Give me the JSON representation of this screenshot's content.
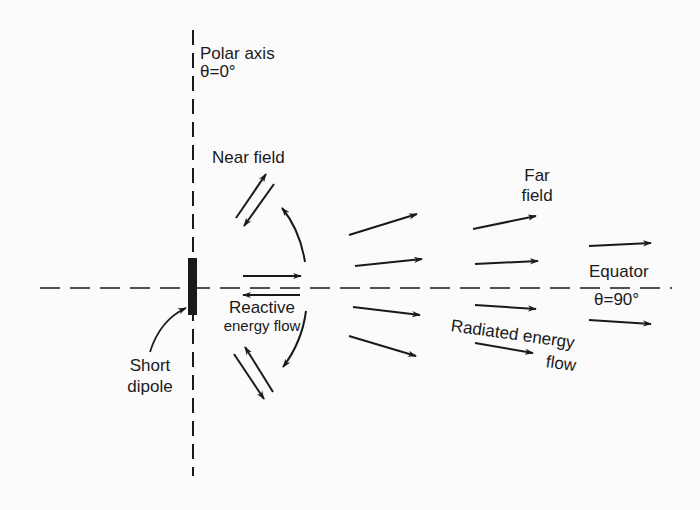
{
  "diagram": {
    "colors": {
      "ink": "#1a1a1a",
      "background": "#fbfbfb"
    },
    "labels": {
      "polar_axis": "Polar axis",
      "polar_angle": "θ=0°",
      "near_field": "Near field",
      "far_field_line1": "Far",
      "far_field_line2": "field",
      "equator": "Equator",
      "equator_angle": "θ=90°",
      "reactive_line1": "Reactive",
      "reactive_line2": "energy flow",
      "radiated_line1": "Radiated energy",
      "radiated_line2": "flow",
      "dipole_line1": "Short",
      "dipole_line2": "dipole"
    },
    "elements": {
      "polar_axis_line": {
        "x": 193,
        "y1": 30,
        "y2": 476,
        "style": "dashed"
      },
      "equator_line": {
        "y": 288,
        "x1": 40,
        "x2": 672,
        "style": "dashed"
      },
      "dipole": {
        "x": 188,
        "y": 258,
        "width": 9,
        "height": 57
      },
      "near_field_arrows": [
        {
          "from": [
            236,
            218
          ],
          "to": [
            266,
            174
          ]
        },
        {
          "from": [
            274,
            184
          ],
          "to": [
            244,
            226
          ]
        },
        {
          "from": [
            243,
            276
          ],
          "to": [
            301,
            276
          ]
        },
        {
          "from": [
            300,
            295
          ],
          "to": [
            243,
            295
          ]
        },
        {
          "from": [
            234,
            354
          ],
          "to": [
            264,
            399
          ]
        },
        {
          "from": [
            273,
            392
          ],
          "to": [
            245,
            347
          ]
        }
      ],
      "curved_arrows": [
        {
          "path": "M305,262 Q300,230 282,208"
        },
        {
          "path": "M306,311 Q302,342 283,367"
        }
      ],
      "far_field_arrows": [
        {
          "from": [
            349,
            235
          ],
          "to": [
            417,
            214
          ]
        },
        {
          "from": [
            355,
            266
          ],
          "to": [
            422,
            259
          ]
        },
        {
          "from": [
            353,
            307
          ],
          "to": [
            420,
            315
          ]
        },
        {
          "from": [
            349,
            336
          ],
          "to": [
            416,
            356
          ]
        },
        {
          "from": [
            473,
            229
          ],
          "to": [
            536,
            216
          ]
        },
        {
          "from": [
            475,
            264
          ],
          "to": [
            538,
            261
          ]
        },
        {
          "from": [
            475,
            305
          ],
          "to": [
            536,
            309
          ]
        },
        {
          "from": [
            475,
            343
          ],
          "to": [
            533,
            353
          ]
        },
        {
          "from": [
            589,
            246
          ],
          "to": [
            651,
            243
          ]
        },
        {
          "from": [
            589,
            320
          ],
          "to": [
            651,
            324
          ]
        }
      ],
      "dipole_pointer": {
        "path": "M150,352 Q160,320 186,308"
      }
    }
  }
}
